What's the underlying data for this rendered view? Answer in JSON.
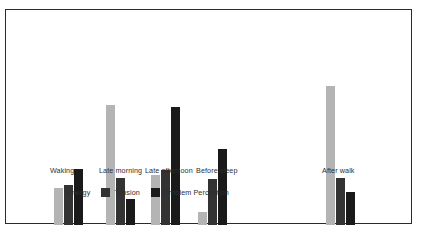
{
  "chart_data": {
    "type": "bar",
    "title": "",
    "subtitle": "",
    "xlabel": "",
    "ylabel": "",
    "grid": false,
    "axes_visible": false,
    "legend_position": "bottom-left",
    "ylim": [
      0,
      130
    ],
    "categories": [
      "Waking",
      "Late morning",
      "Late afternoon",
      "Before sleep",
      "After walk"
    ],
    "series": [
      {
        "name": "Energy",
        "color": "#b4b4b4",
        "values": [
          28,
          103,
          43,
          11,
          119
        ]
      },
      {
        "name": "Tension",
        "color": "#333333",
        "values": [
          34,
          40,
          47,
          39,
          40
        ]
      },
      {
        "name": "Problem Perception",
        "color": "#1a1a1a",
        "values": [
          48,
          22,
          101,
          65,
          28
        ]
      }
    ]
  },
  "chart": {
    "categories": [
      {
        "label": "Waking"
      },
      {
        "label": "Late morning"
      },
      {
        "label": "Late afternoon"
      },
      {
        "label": "Before sleep"
      },
      {
        "label": "After walk"
      }
    ],
    "legend": [
      {
        "label": "Energy",
        "swatch": "energy-swatch"
      },
      {
        "label": "Tension",
        "swatch": "tension-swatch"
      },
      {
        "label": "Problem Perception",
        "swatch": "problem-perception-swatch"
      }
    ]
  }
}
